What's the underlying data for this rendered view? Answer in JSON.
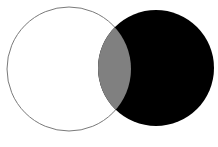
{
  "diagram": {
    "type": "venn",
    "sets": [
      {
        "name": "left-set",
        "fill": "#ffffff",
        "stroke": "#7a7a7a",
        "cx": 69,
        "cy": 69,
        "r": 62
      },
      {
        "name": "right-set",
        "fill": "#000000",
        "stroke": "#000000",
        "cx": 156,
        "cy": 68,
        "r": 58
      }
    ],
    "intersection": {
      "fill": "#808080"
    },
    "caption": ""
  }
}
